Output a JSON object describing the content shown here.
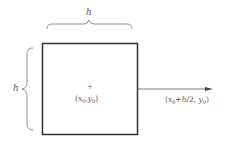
{
  "diagram": {
    "square": {
      "x": 42,
      "y": 43,
      "width": 96,
      "height": 92,
      "stroke": "#333333",
      "stroke_width": 1.5
    },
    "top_brace_label": "h",
    "left_brace_label": "h",
    "center_marker": "+",
    "center_label": {
      "open": "(",
      "x": "x",
      "x_sub": "0",
      "sep": ",",
      "y": "y",
      "y_sub": "0",
      "close": ")"
    },
    "arrow": {
      "from_x": 138,
      "to_x": 213,
      "y": 89,
      "color": "#444444"
    },
    "arrow_label": {
      "open": "(",
      "x": "x",
      "x_sub": "0",
      "plus": "+",
      "h": "h",
      "rest": "/2, ",
      "y": "y",
      "y_sub": "0",
      "close": ")"
    },
    "colors": {
      "line": "#333333",
      "text": "#555555",
      "background": "#ffffff"
    }
  }
}
